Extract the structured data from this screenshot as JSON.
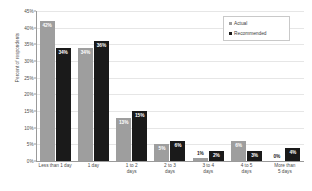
{
  "chart_data": {
    "type": "bar",
    "title": "",
    "xlabel": "",
    "ylabel": "Percent of respondents",
    "ylim": [
      0,
      45
    ],
    "ytick_labels": [
      "45%",
      "40%",
      "35%",
      "30%",
      "25%",
      "20%",
      "15%",
      "10%",
      "5%",
      "0%"
    ],
    "ytick_values": [
      45,
      40,
      35,
      30,
      25,
      20,
      15,
      10,
      5,
      0
    ],
    "grid": true,
    "legend_position": "top-right",
    "categories": [
      "Less than 1 day",
      "1 day",
      "1 to 2\ndays",
      "2 to 3\ndays",
      "3 to 4\ndays",
      "4 to 5\ndays",
      "More than\n5 days"
    ],
    "series": [
      {
        "name": "Actual",
        "color": "#9e9e9e",
        "values": [
          42,
          34,
          13,
          5,
          1,
          6,
          0
        ],
        "labels": [
          "42%",
          "34%",
          "13%",
          "5%",
          "1%",
          "6%",
          "0%"
        ]
      },
      {
        "name": "Recommended",
        "color": "#1a1a1a",
        "values": [
          34,
          36,
          15,
          6,
          3,
          3,
          4
        ],
        "labels": [
          "34%",
          "36%",
          "15%",
          "6%",
          "2%",
          "3%",
          "4%"
        ]
      }
    ]
  },
  "legend": {
    "items": [
      {
        "label": "Actual",
        "swatch": "actual"
      },
      {
        "label": "Recommended",
        "swatch": "recommended"
      }
    ]
  }
}
